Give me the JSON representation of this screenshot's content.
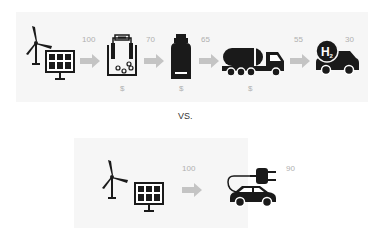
{
  "top_chain": {
    "steps": [
      {
        "name": "renewable-source",
        "icon": "wind-turbine-and-solar-panel"
      },
      {
        "name": "electrolyzer",
        "icon": "electrolysis-tank",
        "cost": "$"
      },
      {
        "name": "storage",
        "icon": "hydrogen-tank",
        "cost": "$"
      },
      {
        "name": "transport",
        "icon": "tanker-truck",
        "cost": "$"
      },
      {
        "name": "fuel-cell-car",
        "icon": "h2-car",
        "badge": "H2"
      }
    ],
    "values": [
      "100",
      "70",
      "65",
      "55",
      "30"
    ],
    "costs": [
      "$",
      "$",
      "$"
    ]
  },
  "separator": "VS.",
  "bottom_chain": {
    "steps": [
      {
        "name": "renewable-source",
        "icon": "wind-turbine-and-solar-panel"
      },
      {
        "name": "electric-car",
        "icon": "plug-car"
      }
    ],
    "values": [
      "100",
      "90"
    ]
  },
  "colors": {
    "icon": "#1a1a1a",
    "arrow": "#c4c4c4",
    "label": "#b0b0b0",
    "panel": "#f6f6f6"
  }
}
